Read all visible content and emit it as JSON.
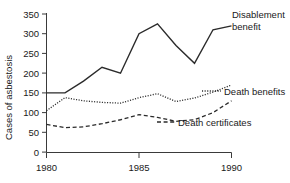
{
  "chart_data": {
    "type": "line",
    "title": "",
    "xlabel": "",
    "ylabel": "Cases of asbestosis",
    "xlim": [
      1980,
      1990
    ],
    "ylim": [
      0,
      350
    ],
    "grid": false,
    "legend_position": "inline-annotations",
    "x_ticks": [
      "1980",
      "1985",
      "1990"
    ],
    "x_tick_values": [
      1980,
      1985,
      1990
    ],
    "y_ticks": [
      "0",
      "50",
      "100",
      "150",
      "200",
      "250",
      "300",
      "350"
    ],
    "y_tick_values": [
      0,
      50,
      100,
      150,
      200,
      250,
      300,
      350
    ],
    "x": [
      1980,
      1981,
      1982,
      1983,
      1984,
      1985,
      1986,
      1987,
      1988,
      1989,
      1990
    ],
    "series": [
      {
        "name": "Disablement benefit",
        "style": "solid",
        "color": "#2b2b2b",
        "values": [
          150,
          150,
          180,
          215,
          200,
          300,
          325,
          270,
          225,
          310,
          320
        ]
      },
      {
        "name": "Death benefits",
        "style": "dotted",
        "color": "#2b2b2b",
        "values": [
          105,
          138,
          130,
          126,
          124,
          138,
          148,
          128,
          137,
          152,
          170
        ]
      },
      {
        "name": "Death certificates",
        "style": "dashed",
        "color": "#2b2b2b",
        "values": [
          70,
          62,
          64,
          72,
          82,
          95,
          88,
          78,
          82,
          100,
          130
        ]
      }
    ],
    "annotations": [
      {
        "name": "disablement-benefit-label",
        "text_line1": "Disablement",
        "text_line2": "benefit",
        "x": 232,
        "y": 18
      },
      {
        "name": "death-benefits-label",
        "text_line1": "Death benefits",
        "text_line2": "",
        "x": 224,
        "y": 95
      },
      {
        "name": "death-certificates-label",
        "text_line1": "Death certificates",
        "text_line2": "",
        "x": 178,
        "y": 126
      }
    ]
  },
  "axis": {
    "y_title": "Cases of asbestosis"
  }
}
